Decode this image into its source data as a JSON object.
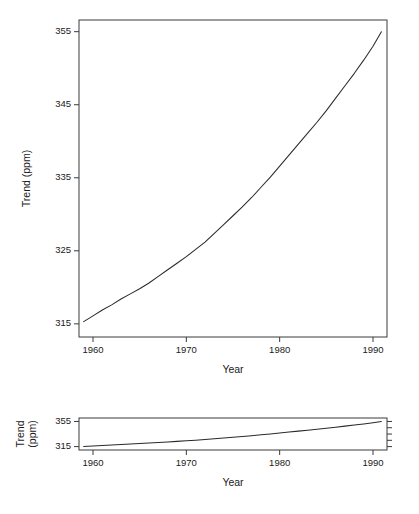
{
  "chart_data": [
    {
      "id": "upper-panel",
      "type": "line",
      "title": "",
      "xlabel": "Year",
      "ylabel": "Trend (ppm)",
      "xlim": [
        1958.5,
        1991.5
      ],
      "ylim": [
        313.2,
        356.6
      ],
      "xticks": [
        1960,
        1970,
        1980,
        1990
      ],
      "xticklabels": [
        "1960",
        "1970",
        "1980",
        "1990"
      ],
      "yticks": [
        315,
        325,
        335,
        345,
        355
      ],
      "yticklabels": [
        "315",
        "325",
        "335",
        "345",
        "355"
      ],
      "grid": false,
      "legend": null,
      "series": [
        {
          "name": "Trend",
          "x": [
            1959.0,
            1960.0,
            1961.0,
            1962.0,
            1963.0,
            1964.0,
            1965.0,
            1966.0,
            1967.0,
            1968.0,
            1969.0,
            1970.0,
            1971.0,
            1972.0,
            1973.0,
            1974.0,
            1975.0,
            1976.0,
            1977.0,
            1978.0,
            1979.0,
            1980.0,
            1981.0,
            1982.0,
            1983.0,
            1984.0,
            1985.0,
            1986.0,
            1987.0,
            1988.0,
            1989.0,
            1990.0,
            1990.9
          ],
          "values": [
            315.3,
            316.1,
            316.9,
            317.6,
            318.4,
            319.1,
            319.8,
            320.6,
            321.5,
            322.4,
            323.3,
            324.2,
            325.2,
            326.2,
            327.4,
            328.6,
            329.8,
            331.0,
            332.3,
            333.7,
            335.1,
            336.6,
            338.1,
            339.6,
            341.1,
            342.6,
            344.2,
            345.9,
            347.6,
            349.3,
            351.1,
            353.0,
            355.0
          ]
        }
      ]
    },
    {
      "id": "lower-panel",
      "type": "line",
      "title": "",
      "xlabel": "Year",
      "ylabel": "Trend (ppm)",
      "ylabel_line1": "Trend",
      "ylabel_line2": "(ppm)",
      "xlim": [
        1958.5,
        1991.5
      ],
      "ylim": [
        309.6,
        360.5
      ],
      "xticks": [
        1960,
        1970,
        1980,
        1990
      ],
      "xticklabels": [
        "1960",
        "1970",
        "1980",
        "1990"
      ],
      "yticks": [
        315,
        355
      ],
      "yticklabels": [
        "315",
        "355"
      ],
      "grid": false,
      "legend": null,
      "series": [
        {
          "name": "Trend",
          "x": [
            1959.0,
            1960.0,
            1961.0,
            1962.0,
            1963.0,
            1964.0,
            1965.0,
            1966.0,
            1967.0,
            1968.0,
            1969.0,
            1970.0,
            1971.0,
            1972.0,
            1973.0,
            1974.0,
            1975.0,
            1976.0,
            1977.0,
            1978.0,
            1979.0,
            1980.0,
            1981.0,
            1982.0,
            1983.0,
            1984.0,
            1985.0,
            1986.0,
            1987.0,
            1988.0,
            1989.0,
            1990.0,
            1990.9
          ],
          "values": [
            315.3,
            316.1,
            316.9,
            317.6,
            318.4,
            319.1,
            319.8,
            320.6,
            321.5,
            322.4,
            323.3,
            324.2,
            325.2,
            326.2,
            327.4,
            328.6,
            329.8,
            331.0,
            332.3,
            333.7,
            335.1,
            336.6,
            338.1,
            339.6,
            341.1,
            342.6,
            344.2,
            345.9,
            347.6,
            349.3,
            351.1,
            353.0,
            355.0
          ]
        }
      ]
    }
  ],
  "style": {
    "background": "#ffffff",
    "line_color": "#2a2a2a",
    "axis_color": "#3a3a3a",
    "text_color": "#1a1a1a"
  },
  "layout": {
    "upper": {
      "left": 79,
      "right": 387,
      "top": 20,
      "bottom": 337
    },
    "lower": {
      "left": 79,
      "right": 387,
      "top": 418,
      "bottom": 450
    }
  }
}
